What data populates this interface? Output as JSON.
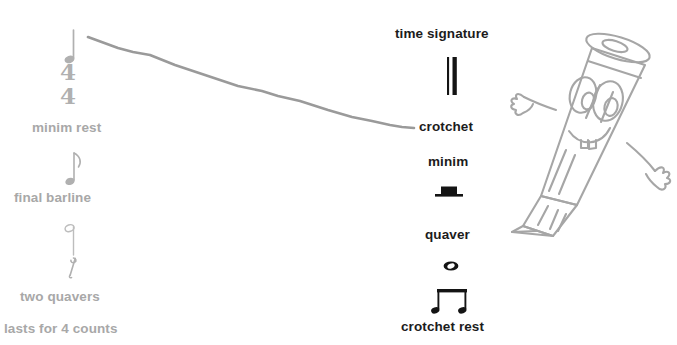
{
  "worksheet": {
    "type": "music-notation-matching-exercise",
    "background_color": "#ffffff",
    "left_label_color": "#a8a8a8",
    "right_label_color": "#1c1c1c",
    "line_color": "#9a9a9a",
    "mascot_color": "#a6a6a6"
  },
  "left_column": {
    "labels": [
      {
        "id": "minim-rest",
        "text": "minim rest",
        "x": 32,
        "y": 121
      },
      {
        "id": "final-barline",
        "text": "final barline",
        "x": 14,
        "y": 191
      },
      {
        "id": "two-quavers",
        "text": "two quavers",
        "x": 20,
        "y": 290
      },
      {
        "id": "lasts-for-4-counts",
        "text": "lasts for 4 counts",
        "x": 4,
        "y": 322
      }
    ],
    "symbols": [
      {
        "id": "crotchet-note",
        "name": "crotchet",
        "x": 62,
        "y": 26
      },
      {
        "id": "time-signature-44",
        "name": "four-four",
        "top": "4",
        "bottom": "4",
        "x": 62,
        "y": 63
      },
      {
        "id": "quaver-note",
        "name": "quaver",
        "x": 62,
        "y": 150
      },
      {
        "id": "minim-note",
        "name": "minim",
        "x": 62,
        "y": 222
      },
      {
        "id": "quaver-rest",
        "name": "quaver-rest",
        "x": 62,
        "y": 253
      }
    ]
  },
  "right_column": {
    "labels": [
      {
        "id": "time-signature",
        "text": "time signature",
        "x": 395,
        "y": 27
      },
      {
        "id": "crotchet",
        "text": "crotchet",
        "x": 419,
        "y": 120
      },
      {
        "id": "minim",
        "text": "minim",
        "x": 428,
        "y": 155
      },
      {
        "id": "quaver",
        "text": "quaver",
        "x": 425,
        "y": 228
      },
      {
        "id": "crotchet-rest",
        "text": "crotchet rest",
        "x": 401,
        "y": 320
      }
    ],
    "symbols": [
      {
        "id": "final-barline-symbol",
        "name": "final-barline",
        "x": 445,
        "y": 57
      },
      {
        "id": "minim-rest-symbol",
        "name": "minim-rest",
        "x": 445,
        "y": 190
      },
      {
        "id": "semibreve-symbol",
        "name": "semibreve",
        "x": 447,
        "y": 262
      },
      {
        "id": "two-quavers-symbol",
        "name": "two-quavers",
        "x": 447,
        "y": 293
      }
    ]
  },
  "connector_line": {
    "id": "match-line-crotchet",
    "from_label": "crotchet note (left)",
    "to_label": "crotchet",
    "start": {
      "x": 88,
      "y": 37
    },
    "end": {
      "x": 414,
      "y": 128
    }
  },
  "mascot": {
    "id": "pencil-character",
    "name": "cartoon-pencil",
    "description": "smiling cartoon pencil with two large eyes, two teeth and waving arms",
    "x": 505,
    "y": 25,
    "width": 172,
    "height": 220
  }
}
